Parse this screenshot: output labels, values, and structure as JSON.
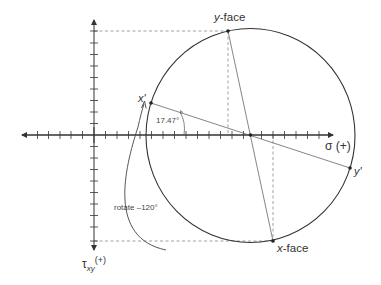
{
  "diagram": {
    "type": "mohr-circle",
    "colors": {
      "line": "#333333",
      "thin": "#666666",
      "dash": "#888888",
      "text": "#333333"
    },
    "axes": {
      "sigma_label": "σ (+)",
      "tau_label_main": "τ",
      "tau_label_sub": "xy",
      "tau_label_suffix": "(+)"
    },
    "points": {
      "y_face": {
        "label": "y-face",
        "label_italic_part": "y",
        "label_rest": "-face"
      },
      "x_face": {
        "label": "x-face",
        "label_italic_part": "x",
        "label_rest": "-face"
      },
      "x_prime": {
        "label": "x'"
      },
      "y_prime": {
        "label": "y'"
      }
    },
    "annotations": {
      "angle": "17.47°",
      "rotate": "rotate –120°"
    }
  }
}
